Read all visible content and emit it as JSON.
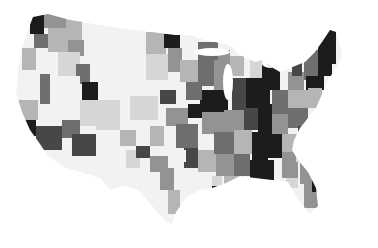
{
  "map": {
    "type": "choropleth",
    "region": "contiguous-united-states",
    "color_scale": "grayscale",
    "scale_colors": [
      "#f2f2f2",
      "#d6d6d6",
      "#b5b5b5",
      "#939393",
      "#6e6e6e",
      "#474747",
      "#1e1e1e"
    ],
    "background": "#ffffff",
    "outline": [
      [
        33,
        17
      ],
      [
        48,
        14
      ],
      [
        70,
        20
      ],
      [
        120,
        28
      ],
      [
        175,
        35
      ],
      [
        190,
        35
      ],
      [
        205,
        40
      ],
      [
        230,
        45
      ],
      [
        240,
        55
      ],
      [
        255,
        62
      ],
      [
        262,
        60
      ],
      [
        268,
        65
      ],
      [
        280,
        72
      ],
      [
        290,
        68
      ],
      [
        305,
        62
      ],
      [
        315,
        52
      ],
      [
        322,
        42
      ],
      [
        330,
        30
      ],
      [
        336,
        32
      ],
      [
        340,
        44
      ],
      [
        342,
        56
      ],
      [
        336,
        68
      ],
      [
        328,
        80
      ],
      [
        322,
        94
      ],
      [
        316,
        108
      ],
      [
        308,
        118
      ],
      [
        300,
        128
      ],
      [
        294,
        140
      ],
      [
        292,
        150
      ],
      [
        298,
        160
      ],
      [
        308,
        172
      ],
      [
        316,
        188
      ],
      [
        318,
        206
      ],
      [
        310,
        214
      ],
      [
        298,
        200
      ],
      [
        288,
        182
      ],
      [
        272,
        180
      ],
      [
        255,
        178
      ],
      [
        240,
        176
      ],
      [
        226,
        183
      ],
      [
        212,
        188
      ],
      [
        200,
        190
      ],
      [
        186,
        198
      ],
      [
        176,
        212
      ],
      [
        172,
        224
      ],
      [
        166,
        222
      ],
      [
        152,
        206
      ],
      [
        138,
        190
      ],
      [
        124,
        186
      ],
      [
        110,
        190
      ],
      [
        100,
        178
      ],
      [
        80,
        172
      ],
      [
        66,
        168
      ],
      [
        48,
        156
      ],
      [
        40,
        144
      ],
      [
        30,
        130
      ],
      [
        22,
        112
      ],
      [
        16,
        92
      ],
      [
        18,
        70
      ],
      [
        22,
        48
      ],
      [
        28,
        30
      ]
    ],
    "regions": [
      {
        "x": 30,
        "y": 14,
        "w": 14,
        "h": 20,
        "shade": 6
      },
      {
        "x": 44,
        "y": 14,
        "w": 22,
        "h": 14,
        "shade": 3
      },
      {
        "x": 66,
        "y": 18,
        "w": 16,
        "h": 22,
        "shade": 2
      },
      {
        "x": 34,
        "y": 34,
        "w": 14,
        "h": 14,
        "shade": 4
      },
      {
        "x": 48,
        "y": 28,
        "w": 20,
        "h": 24,
        "shade": 2
      },
      {
        "x": 68,
        "y": 40,
        "w": 16,
        "h": 16,
        "shade": 3
      },
      {
        "x": 22,
        "y": 48,
        "w": 14,
        "h": 22,
        "shade": 2
      },
      {
        "x": 36,
        "y": 52,
        "w": 22,
        "h": 22,
        "shade": 0
      },
      {
        "x": 58,
        "y": 52,
        "w": 22,
        "h": 24,
        "shade": 1
      },
      {
        "x": 76,
        "y": 64,
        "w": 14,
        "h": 20,
        "shade": 4
      },
      {
        "x": 82,
        "y": 82,
        "w": 16,
        "h": 20,
        "shade": 6
      },
      {
        "x": 98,
        "y": 30,
        "w": 48,
        "h": 56,
        "shade": 0
      },
      {
        "x": 146,
        "y": 32,
        "w": 20,
        "h": 22,
        "shade": 2
      },
      {
        "x": 164,
        "y": 34,
        "w": 16,
        "h": 14,
        "shade": 6
      },
      {
        "x": 168,
        "y": 48,
        "w": 14,
        "h": 24,
        "shade": 3
      },
      {
        "x": 146,
        "y": 54,
        "w": 22,
        "h": 26,
        "shade": 1
      },
      {
        "x": 160,
        "y": 90,
        "w": 16,
        "h": 14,
        "shade": 5
      },
      {
        "x": 130,
        "y": 96,
        "w": 28,
        "h": 24,
        "shade": 1
      },
      {
        "x": 20,
        "y": 70,
        "w": 20,
        "h": 30,
        "shade": 0
      },
      {
        "x": 40,
        "y": 74,
        "w": 10,
        "h": 30,
        "shade": 4
      },
      {
        "x": 50,
        "y": 76,
        "w": 30,
        "h": 30,
        "shade": 0
      },
      {
        "x": 18,
        "y": 100,
        "w": 20,
        "h": 20,
        "shade": 2
      },
      {
        "x": 22,
        "y": 120,
        "w": 14,
        "h": 16,
        "shade": 6
      },
      {
        "x": 36,
        "y": 126,
        "w": 26,
        "h": 24,
        "shade": 5
      },
      {
        "x": 62,
        "y": 120,
        "w": 18,
        "h": 18,
        "shade": 4
      },
      {
        "x": 72,
        "y": 134,
        "w": 26,
        "h": 22,
        "shade": 5
      },
      {
        "x": 80,
        "y": 100,
        "w": 16,
        "h": 26,
        "shade": 1
      },
      {
        "x": 96,
        "y": 100,
        "w": 24,
        "h": 30,
        "shade": 1
      },
      {
        "x": 96,
        "y": 130,
        "w": 30,
        "h": 40,
        "shade": 0
      },
      {
        "x": 120,
        "y": 130,
        "w": 16,
        "h": 16,
        "shade": 2
      },
      {
        "x": 126,
        "y": 150,
        "w": 14,
        "h": 18,
        "shade": 1
      },
      {
        "x": 136,
        "y": 146,
        "w": 14,
        "h": 12,
        "shade": 5
      },
      {
        "x": 150,
        "y": 126,
        "w": 14,
        "h": 20,
        "shade": 2
      },
      {
        "x": 150,
        "y": 156,
        "w": 18,
        "h": 16,
        "shade": 3
      },
      {
        "x": 160,
        "y": 168,
        "w": 14,
        "h": 22,
        "shade": 3
      },
      {
        "x": 168,
        "y": 190,
        "w": 12,
        "h": 24,
        "shade": 2
      },
      {
        "x": 166,
        "y": 108,
        "w": 22,
        "h": 18,
        "shade": 3
      },
      {
        "x": 176,
        "y": 124,
        "w": 22,
        "h": 24,
        "shade": 4
      },
      {
        "x": 188,
        "y": 104,
        "w": 14,
        "h": 14,
        "shade": 6
      },
      {
        "x": 200,
        "y": 90,
        "w": 28,
        "h": 22,
        "shade": 6
      },
      {
        "x": 186,
        "y": 82,
        "w": 16,
        "h": 18,
        "shade": 4
      },
      {
        "x": 202,
        "y": 112,
        "w": 22,
        "h": 22,
        "shade": 3
      },
      {
        "x": 184,
        "y": 148,
        "w": 14,
        "h": 20,
        "shade": 5
      },
      {
        "x": 198,
        "y": 150,
        "w": 18,
        "h": 22,
        "shade": 2
      },
      {
        "x": 214,
        "y": 132,
        "w": 20,
        "h": 22,
        "shade": 4
      },
      {
        "x": 180,
        "y": 60,
        "w": 18,
        "h": 22,
        "shade": 2
      },
      {
        "x": 198,
        "y": 60,
        "w": 16,
        "h": 26,
        "shade": 4
      },
      {
        "x": 214,
        "y": 50,
        "w": 16,
        "h": 22,
        "shade": 3
      },
      {
        "x": 198,
        "y": 42,
        "w": 20,
        "h": 18,
        "shade": 4
      },
      {
        "x": 214,
        "y": 72,
        "w": 18,
        "h": 18,
        "shade": 3
      },
      {
        "x": 230,
        "y": 56,
        "w": 14,
        "h": 20,
        "shade": 2
      },
      {
        "x": 224,
        "y": 110,
        "w": 20,
        "h": 22,
        "shade": 3
      },
      {
        "x": 232,
        "y": 90,
        "w": 14,
        "h": 20,
        "shade": 5
      },
      {
        "x": 234,
        "y": 130,
        "w": 18,
        "h": 24,
        "shade": 2
      },
      {
        "x": 216,
        "y": 154,
        "w": 18,
        "h": 22,
        "shade": 3
      },
      {
        "x": 234,
        "y": 154,
        "w": 16,
        "h": 22,
        "shade": 4
      },
      {
        "x": 250,
        "y": 60,
        "w": 12,
        "h": 24,
        "shade": 1
      },
      {
        "x": 246,
        "y": 78,
        "w": 24,
        "h": 30,
        "shade": 6
      },
      {
        "x": 262,
        "y": 64,
        "w": 18,
        "h": 26,
        "shade": 6
      },
      {
        "x": 244,
        "y": 108,
        "w": 14,
        "h": 22,
        "shade": 5
      },
      {
        "x": 258,
        "y": 104,
        "w": 14,
        "h": 28,
        "shade": 6
      },
      {
        "x": 252,
        "y": 132,
        "w": 16,
        "h": 28,
        "shade": 6
      },
      {
        "x": 268,
        "y": 132,
        "w": 14,
        "h": 26,
        "shade": 6
      },
      {
        "x": 250,
        "y": 160,
        "w": 24,
        "h": 20,
        "shade": 6
      },
      {
        "x": 272,
        "y": 90,
        "w": 16,
        "h": 24,
        "shade": 4
      },
      {
        "x": 272,
        "y": 114,
        "w": 16,
        "h": 20,
        "shade": 3
      },
      {
        "x": 282,
        "y": 134,
        "w": 16,
        "h": 18,
        "shade": 2
      },
      {
        "x": 282,
        "y": 152,
        "w": 16,
        "h": 26,
        "shade": 3
      },
      {
        "x": 288,
        "y": 72,
        "w": 16,
        "h": 18,
        "shade": 3
      },
      {
        "x": 288,
        "y": 90,
        "w": 20,
        "h": 18,
        "shade": 2
      },
      {
        "x": 288,
        "y": 108,
        "w": 20,
        "h": 20,
        "shade": 4
      },
      {
        "x": 298,
        "y": 126,
        "w": 16,
        "h": 20,
        "shade": 5
      },
      {
        "x": 296,
        "y": 146,
        "w": 14,
        "h": 16,
        "shade": 1
      },
      {
        "x": 300,
        "y": 160,
        "w": 14,
        "h": 24,
        "shade": 3
      },
      {
        "x": 304,
        "y": 184,
        "w": 14,
        "h": 24,
        "shade": 3
      },
      {
        "x": 312,
        "y": 172,
        "w": 6,
        "h": 20,
        "shade": 6
      },
      {
        "x": 304,
        "y": 62,
        "w": 14,
        "h": 18,
        "shade": 4
      },
      {
        "x": 302,
        "y": 50,
        "w": 16,
        "h": 12,
        "shade": 4
      },
      {
        "x": 318,
        "y": 30,
        "w": 18,
        "h": 34,
        "shade": 6
      },
      {
        "x": 318,
        "y": 62,
        "w": 14,
        "h": 14,
        "shade": 6
      },
      {
        "x": 306,
        "y": 76,
        "w": 18,
        "h": 14,
        "shade": 6
      },
      {
        "x": 308,
        "y": 88,
        "w": 14,
        "h": 20,
        "shade": 2
      },
      {
        "x": 292,
        "y": 62,
        "w": 10,
        "h": 14,
        "shade": 5
      },
      {
        "x": 228,
        "y": 78,
        "w": 18,
        "h": 14,
        "shade": 5
      },
      {
        "x": 224,
        "y": 176,
        "w": 20,
        "h": 12,
        "shade": 2
      },
      {
        "x": 208,
        "y": 176,
        "w": 14,
        "h": 14,
        "shade": 1
      },
      {
        "x": 200,
        "y": 172,
        "w": 12,
        "h": 18,
        "shade": 0
      },
      {
        "x": 212,
        "y": 186,
        "w": 12,
        "h": 6,
        "shade": 6
      },
      {
        "x": 286,
        "y": 178,
        "w": 12,
        "h": 10,
        "shade": 1
      },
      {
        "x": 176,
        "y": 150,
        "w": 10,
        "h": 12,
        "shade": 0
      }
    ],
    "lakes": [
      {
        "cx": 228,
        "cy": 82,
        "rx": 5,
        "ry": 18
      },
      {
        "cx": 212,
        "cy": 52,
        "rx": 18,
        "ry": 4
      },
      {
        "cx": 272,
        "cy": 64,
        "rx": 10,
        "ry": 4
      }
    ]
  }
}
